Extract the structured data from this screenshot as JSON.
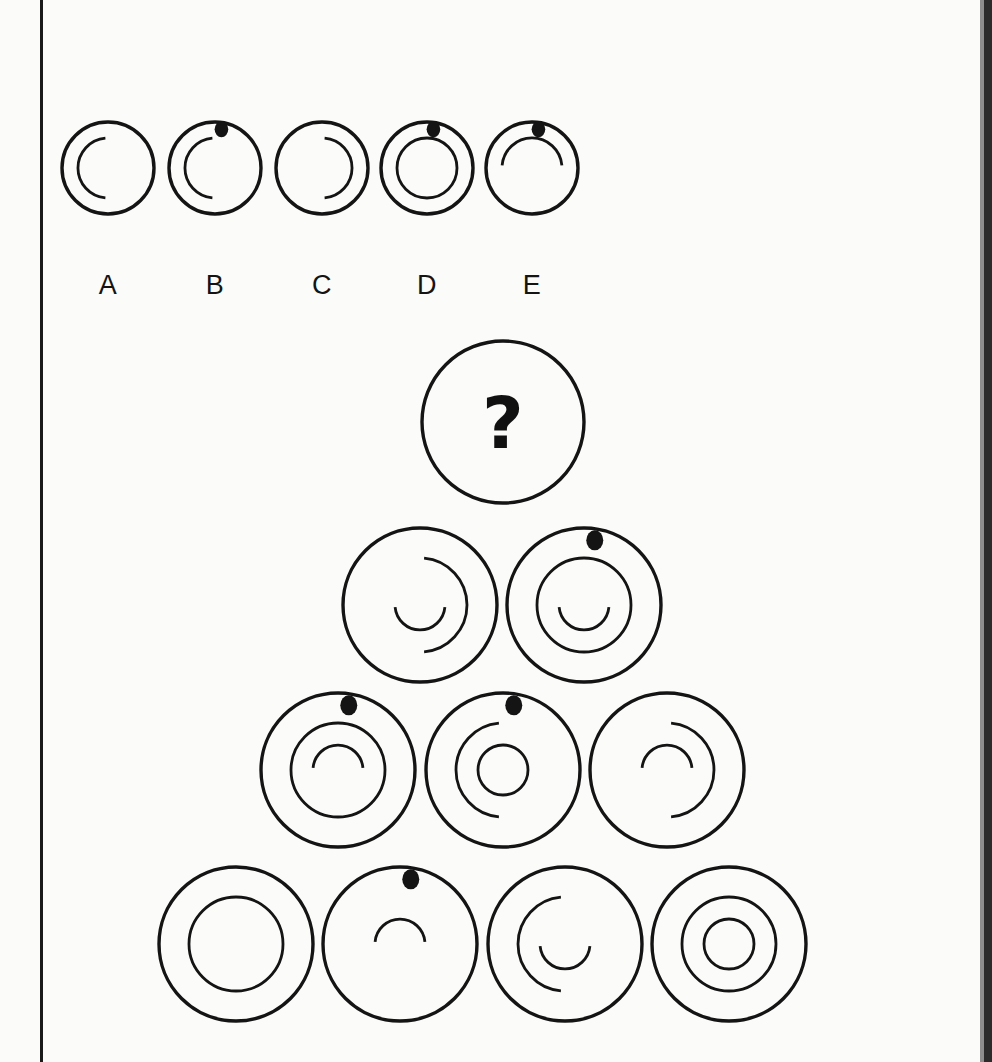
{
  "puzzle": {
    "type": "visual-analogy-matrix",
    "title_visible": false,
    "question_marker": "?",
    "stroke_color": "#141414",
    "dot_color": "#141414",
    "background_color": "#fbfbf9",
    "options": {
      "labels": [
        "A",
        "B",
        "C",
        "D",
        "E"
      ],
      "items": [
        {
          "label": "A",
          "cx": 108,
          "cy": 168,
          "r": 46,
          "dot": false,
          "medium": {
            "shape": "arc-open-right",
            "r": 30
          },
          "small": {
            "shape": "none"
          }
        },
        {
          "label": "B",
          "cx": 215,
          "cy": 168,
          "r": 46,
          "dot": true,
          "medium": {
            "shape": "arc-open-right",
            "r": 30
          },
          "small": {
            "shape": "none"
          }
        },
        {
          "label": "C",
          "cx": 322,
          "cy": 168,
          "r": 46,
          "dot": false,
          "medium": {
            "shape": "arc-open-left",
            "r": 30
          },
          "small": {
            "shape": "none"
          }
        },
        {
          "label": "D",
          "cx": 427,
          "cy": 168,
          "r": 46,
          "dot": true,
          "medium": {
            "shape": "circle",
            "r": 30
          },
          "small": {
            "shape": "none"
          }
        },
        {
          "label": "E",
          "cx": 532,
          "cy": 168,
          "r": 46,
          "dot": true,
          "medium": {
            "shape": "arc-open-down",
            "r": 30
          },
          "small": {
            "shape": "none"
          }
        }
      ]
    },
    "pyramid": {
      "rows": [
        {
          "row": 1,
          "cells": [
            {
              "id": "r1c1",
              "cx": 503,
              "cy": 422,
              "r": 81,
              "is_question": true,
              "dot": false,
              "medium": {
                "shape": "none"
              },
              "small": {
                "shape": "none"
              }
            }
          ]
        },
        {
          "row": 2,
          "cells": [
            {
              "id": "r2c1",
              "cx": 420,
              "cy": 605,
              "r": 77,
              "is_question": false,
              "dot": false,
              "medium": {
                "shape": "arc-open-left",
                "r": 47
              },
              "small": {
                "shape": "arc-open-up",
                "r": 25
              }
            },
            {
              "id": "r2c2",
              "cx": 584,
              "cy": 605,
              "r": 77,
              "is_question": false,
              "dot": true,
              "medium": {
                "shape": "circle",
                "r": 47
              },
              "small": {
                "shape": "arc-open-up",
                "r": 25
              }
            }
          ]
        },
        {
          "row": 3,
          "cells": [
            {
              "id": "r3c1",
              "cx": 338,
              "cy": 770,
              "r": 77,
              "is_question": false,
              "dot": true,
              "medium": {
                "shape": "circle",
                "r": 47
              },
              "small": {
                "shape": "arc-open-down",
                "r": 25
              }
            },
            {
              "id": "r3c2",
              "cx": 503,
              "cy": 770,
              "r": 77,
              "is_question": false,
              "dot": true,
              "medium": {
                "shape": "arc-open-right",
                "r": 47
              },
              "small": {
                "shape": "circle",
                "r": 25
              }
            },
            {
              "id": "r3c3",
              "cx": 667,
              "cy": 770,
              "r": 77,
              "is_question": false,
              "dot": false,
              "medium": {
                "shape": "arc-open-left",
                "r": 47
              },
              "small": {
                "shape": "arc-open-down",
                "r": 25
              }
            }
          ]
        },
        {
          "row": 4,
          "cells": [
            {
              "id": "r4c1",
              "cx": 236,
              "cy": 944,
              "r": 77,
              "is_question": false,
              "dot": false,
              "medium": {
                "shape": "circle",
                "r": 47
              },
              "small": {
                "shape": "none"
              }
            },
            {
              "id": "r4c2",
              "cx": 400,
              "cy": 944,
              "r": 77,
              "is_question": false,
              "dot": true,
              "medium": {
                "shape": "none"
              },
              "small": {
                "shape": "arc-open-down",
                "r": 25
              }
            },
            {
              "id": "r4c3",
              "cx": 565,
              "cy": 944,
              "r": 77,
              "is_question": false,
              "dot": false,
              "medium": {
                "shape": "arc-open-right",
                "r": 47
              },
              "small": {
                "shape": "arc-open-up",
                "r": 25
              }
            },
            {
              "id": "r4c4",
              "cx": 729,
              "cy": 944,
              "r": 77,
              "is_question": false,
              "dot": false,
              "medium": {
                "shape": "circle",
                "r": 47
              },
              "small": {
                "shape": "circle",
                "r": 25
              }
            }
          ]
        }
      ]
    }
  }
}
